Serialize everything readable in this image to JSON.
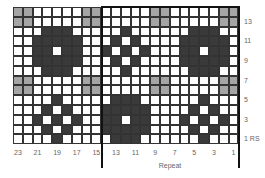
{
  "chart_data": {
    "type": "heatmap",
    "title": "",
    "columns": 23,
    "rows": 14,
    "column_numbering": "right-to-left, 1 at right, 23 at left",
    "row_numbering": "bottom-to-top, 1 at bottom",
    "legend": {
      "d": "dark color",
      "g": "gray color",
      ".": "background (white)"
    },
    "colors": {
      "d": "#3a3a3a",
      "g": "#a5a5a5",
      ".": "#ffffff",
      "grid": "#333333"
    },
    "grid_top_to_bottom": [
      "gg.....gg.....gg.....gg",
      "gg.....gg.....gg.....gg",
      "...ddd.....d......ddd..",
      "..ddddd...d.d....ddddd.",
      "..dd.dd..d.d.d...dd.dd.",
      "..ddddd...d.d....ddddd.",
      "...ddd.....d......ddd..",
      "gg.....gg.....gg.....gg",
      "gg.....gg.....gg.....gg",
      "....d.....ddd......d...",
      "...d.d...ddddd....d.d..",
      "..d.d.d..dd.dd...d.d.d.",
      "...d.d...ddddd....d.d..",
      "....d.....ddd......d..."
    ],
    "x_tick_labels": [
      "23",
      "21",
      "19",
      "17",
      "15",
      "13",
      "11",
      "9",
      "7",
      "5",
      "3",
      "1"
    ],
    "y_tick_labels": [
      "13",
      "11",
      "9",
      "7",
      "5",
      "3",
      "1 RS"
    ],
    "repeat": {
      "label": "Repeat",
      "from_stitch": 14,
      "to_stitch": 1
    }
  },
  "axis": {
    "bottom": [
      "23",
      "21",
      "19",
      "17",
      "15",
      "13",
      "11",
      "9",
      "7",
      "5",
      "3",
      "1"
    ],
    "right": [
      "13",
      "11",
      "9",
      "7",
      "5",
      "3",
      "1 RS"
    ],
    "repeat_label": "Repeat"
  }
}
